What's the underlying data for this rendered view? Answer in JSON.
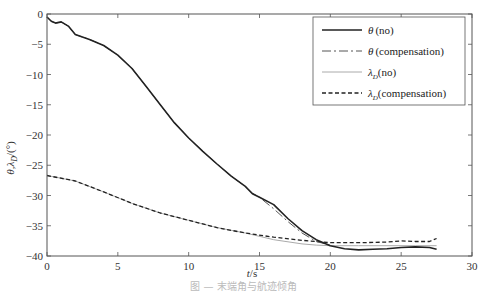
{
  "chart_data": {
    "type": "line",
    "title": "",
    "xlabel": "t/s",
    "ylabel": "θ,λ_D/(°)",
    "xlim": [
      0,
      30
    ],
    "ylim": [
      -40,
      0
    ],
    "xticks": [
      0,
      5,
      10,
      15,
      20,
      25,
      30
    ],
    "yticks": [
      0,
      -5,
      -10,
      -15,
      -20,
      -25,
      -30,
      -35,
      -40
    ],
    "grid": false,
    "legend_position": "upper right",
    "series": [
      {
        "name": "θ (no)",
        "style": "solid-thick",
        "x": [
          0,
          0.3,
          0.6,
          1.0,
          1.5,
          2.0,
          3.0,
          4.0,
          5.0,
          6.0,
          7.0,
          8.0,
          9.0,
          10.0,
          11.0,
          12.0,
          13.0,
          14.0,
          14.5,
          15.0,
          16.0,
          17.0,
          18.0,
          19.0,
          20.0,
          21.0,
          22.0,
          23.0,
          24.0,
          25.0,
          26.0,
          27.0,
          27.5
        ],
        "y": [
          -0.5,
          -1.2,
          -1.5,
          -1.3,
          -2.0,
          -3.4,
          -4.2,
          -5.2,
          -6.8,
          -9.0,
          -12.0,
          -15.0,
          -18.0,
          -20.5,
          -22.7,
          -24.8,
          -26.8,
          -28.5,
          -29.7,
          -30.3,
          -31.5,
          -33.8,
          -35.8,
          -37.3,
          -38.3,
          -38.8,
          -39.0,
          -38.9,
          -38.8,
          -38.6,
          -38.5,
          -38.6,
          -38.9
        ]
      },
      {
        "name": "θ (compensation)",
        "style": "dash-dot",
        "x": [
          0,
          0.3,
          0.6,
          1.0,
          1.5,
          2.0,
          3.0,
          4.0,
          5.0,
          6.0,
          7.0,
          8.0,
          9.0,
          10.0,
          11.0,
          12.0,
          13.0,
          14.0,
          14.5,
          15.0,
          16.0,
          17.0,
          18.0,
          19.0,
          20.0
        ],
        "y": [
          -0.5,
          -1.2,
          -1.5,
          -1.3,
          -2.0,
          -3.4,
          -4.2,
          -5.2,
          -6.8,
          -9.0,
          -12.0,
          -15.0,
          -18.0,
          -20.5,
          -22.7,
          -24.8,
          -26.8,
          -28.5,
          -29.6,
          -30.3,
          -32.2,
          -34.3,
          -36.2,
          -37.6,
          -38.2
        ]
      },
      {
        "name": "λ_D (no)",
        "style": "solid-thin-gray",
        "x": [
          0,
          2,
          4,
          6,
          8,
          10,
          12,
          14,
          16,
          18,
          19,
          20,
          22,
          24,
          26,
          27.5
        ],
        "y": [
          -26.7,
          -27.6,
          -29.4,
          -31.3,
          -32.9,
          -34.1,
          -35.3,
          -36.2,
          -37.3,
          -38.0,
          -38.2,
          -38.3,
          -38.3,
          -38.3,
          -38.3,
          -38.3
        ]
      },
      {
        "name": "λ_D (compensation)",
        "style": "dashed",
        "x": [
          0,
          2,
          4,
          6,
          8,
          10,
          12,
          14,
          16,
          18,
          19,
          20,
          22,
          24,
          25,
          26,
          27,
          27.5
        ],
        "y": [
          -26.7,
          -27.6,
          -29.4,
          -31.3,
          -32.9,
          -34.1,
          -35.3,
          -36.2,
          -36.9,
          -37.4,
          -37.6,
          -37.8,
          -37.8,
          -37.7,
          -37.5,
          -37.6,
          -37.6,
          -37.1
        ]
      }
    ]
  },
  "legend": {
    "items": [
      {
        "symbol": "θ",
        "label": "(no)"
      },
      {
        "symbol": "θ",
        "label": "(compensation)"
      },
      {
        "symbol": "λ",
        "sub": "D",
        "label": "(no)"
      },
      {
        "symbol": "λ",
        "sub": "D",
        "label": "(compensation)"
      }
    ]
  },
  "axes": {
    "xtick_labels": [
      "0",
      "5",
      "10",
      "15",
      "20",
      "25",
      "30"
    ],
    "ytick_labels": [
      "0",
      "−5",
      "−10",
      "−15",
      "−20",
      "−25",
      "−30",
      "−35",
      "−40"
    ],
    "xlabel_italic": "t",
    "xlabel_unit": "/s",
    "ylabel": "θ,λ_D/(°)"
  },
  "caption": "图 — 末端角与航迹倾角"
}
